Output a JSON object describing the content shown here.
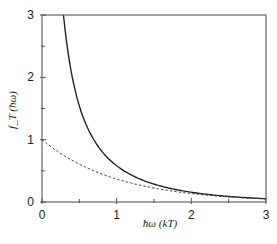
{
  "chart_data": {
    "type": "line",
    "title": "",
    "xlabel": "ħω (kT)",
    "ylabel": "f_T (ħω)",
    "xlim": [
      0,
      3
    ],
    "ylim": [
      0,
      3
    ],
    "x_ticks": [
      0,
      1,
      2,
      3
    ],
    "y_ticks": [
      0,
      1,
      2,
      3
    ],
    "x_minor_ticks": [
      0.5,
      1.5,
      2.5
    ],
    "y_minor_ticks": [
      0.5,
      1.5,
      2.5
    ],
    "grid": false,
    "legend": null,
    "series": [
      {
        "name": "solid",
        "style": "solid",
        "color": "#222222",
        "x": [
          0.29,
          0.35,
          0.4,
          0.5,
          0.6,
          0.7,
          0.8,
          1.0,
          1.2,
          1.5,
          2.0,
          2.5,
          3.0
        ],
        "y": [
          2.99,
          2.39,
          2.03,
          1.54,
          1.22,
          0.99,
          0.82,
          0.58,
          0.43,
          0.29,
          0.16,
          0.09,
          0.05
        ]
      },
      {
        "name": "dashed",
        "style": "dashed",
        "color": "#444444",
        "x": [
          0,
          0.25,
          0.5,
          0.75,
          1.0,
          1.25,
          1.5,
          2.0,
          2.5,
          3.0
        ],
        "y": [
          1.0,
          0.78,
          0.61,
          0.47,
          0.37,
          0.29,
          0.22,
          0.14,
          0.08,
          0.05
        ]
      }
    ]
  }
}
